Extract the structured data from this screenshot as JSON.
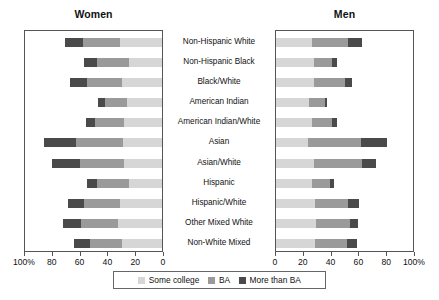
{
  "panels": {
    "left_title": "Women",
    "right_title": "Men"
  },
  "legend": {
    "items": [
      {
        "label": "Some college",
        "color": "#d6d6d6",
        "icon": "square-swatch-icon"
      },
      {
        "label": "BA",
        "color": "#9a9a9a",
        "icon": "square-swatch-icon"
      },
      {
        "label": "More than BA",
        "color": "#4a4a4a",
        "icon": "square-swatch-icon"
      }
    ]
  },
  "axis": {
    "left_ticks": [
      "100%",
      "80",
      "60",
      "40",
      "20",
      "0"
    ],
    "right_ticks": [
      "0",
      "20",
      "40",
      "60",
      "80",
      "100%"
    ]
  },
  "chart_data": {
    "type": "bar",
    "subtype": "back-to-back stacked horizontal bar (population pyramid)",
    "xlabel": "Percent",
    "ylabel": "",
    "xlim": [
      0,
      100
    ],
    "grid": false,
    "legend_position": "bottom-center",
    "stacking": "stacked",
    "series_names": [
      "Some college",
      "BA",
      "More than BA"
    ],
    "series_colors": [
      "#d6d6d6",
      "#9a9a9a",
      "#4a4a4a"
    ],
    "categories": [
      "Non-Hispanic White",
      "Non-Hispanic Black",
      "Black/White",
      "American Indian",
      "American Indian/White",
      "Asian",
      "Asian/White",
      "Hispanic",
      "Hispanic/White",
      "Other Mixed White",
      "Non-White Mixed"
    ],
    "panels": [
      {
        "name": "Women",
        "direction": "right-to-left",
        "series": [
          {
            "name": "Some college",
            "values": [
              30,
              24,
              29,
              25,
              27,
              28,
              27,
              24,
              30,
              32,
              29
            ]
          },
          {
            "name": "BA",
            "values": [
              27,
              23,
              25,
              16,
              21,
              34,
              32,
              23,
              26,
              26,
              23
            ]
          },
          {
            "name": "More than BA",
            "values": [
              13,
              9,
              12,
              5,
              7,
              23,
              20,
              7,
              12,
              13,
              11
            ]
          }
        ],
        "totals": [
          70,
          56,
          66,
          46,
          55,
          85,
          79,
          54,
          68,
          71,
          63
        ]
      },
      {
        "name": "Men",
        "direction": "left-to-right",
        "series": [
          {
            "name": "Some college",
            "values": [
              26,
              27,
              27,
              24,
              26,
              23,
              27,
              26,
              28,
              29,
              28
            ]
          },
          {
            "name": "BA",
            "values": [
              26,
              13,
              23,
              11,
              14,
              38,
              35,
              13,
              24,
              24,
              23
            ]
          },
          {
            "name": "More than BA",
            "values": [
              10,
              4,
              5,
              2,
              4,
              19,
              10,
              3,
              8,
              6,
              7
            ]
          }
        ],
        "totals": [
          62,
          44,
          55,
          37,
          44,
          80,
          72,
          42,
          60,
          59,
          58
        ]
      }
    ]
  }
}
